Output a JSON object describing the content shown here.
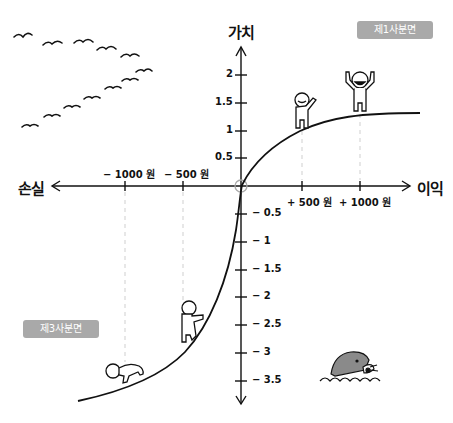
{
  "diagram": {
    "y_axis_label": "가치",
    "x_axis_positive_label": "이익",
    "x_axis_negative_label": "손실",
    "quadrant_badges": [
      {
        "label": "제1사분면"
      },
      {
        "label": "제3사분면"
      }
    ],
    "x_ticks": [
      {
        "label": "− 1000 원",
        "value": -1000
      },
      {
        "label": "− 500 원",
        "value": -500
      },
      {
        "label": "+ 500 원",
        "value": 500
      },
      {
        "label": "+ 1000 원",
        "value": 1000
      }
    ],
    "y_ticks_positive": [
      {
        "label": "2",
        "value": 2
      },
      {
        "label": "1.5",
        "value": 1.5
      },
      {
        "label": "1",
        "value": 1
      },
      {
        "label": "0.5",
        "value": 0.5
      }
    ],
    "y_ticks_negative": [
      {
        "label": "− 0.5",
        "value": -0.5
      },
      {
        "label": "− 1",
        "value": -1
      },
      {
        "label": "− 1.5",
        "value": -1.5
      },
      {
        "label": "− 2",
        "value": -2
      },
      {
        "label": "− 2.5",
        "value": -2.5
      },
      {
        "label": "− 3",
        "value": -3
      },
      {
        "label": "− 3.5",
        "value": -3.5
      }
    ],
    "curve": {
      "description": "Value function: concave for gains (flattens near +1.3), convex and steeper for losses",
      "points": [
        {
          "x": -1000,
          "y": -3.3
        },
        {
          "x": -500,
          "y": -2.4
        },
        {
          "x": 0,
          "y": 0
        },
        {
          "x": 500,
          "y": 1.0
        },
        {
          "x": 1000,
          "y": 1.3
        }
      ]
    },
    "illustrations": [
      "flock-of-birds",
      "waving-person",
      "cheering-person",
      "climbing-person",
      "crawling-person",
      "mole"
    ],
    "colors": {
      "line": "#111111",
      "badge_bg": "#a9a9a9",
      "badge_text": "#ffffff",
      "guide_dash": "#cccccc",
      "mole": "#8a8a8a"
    }
  }
}
